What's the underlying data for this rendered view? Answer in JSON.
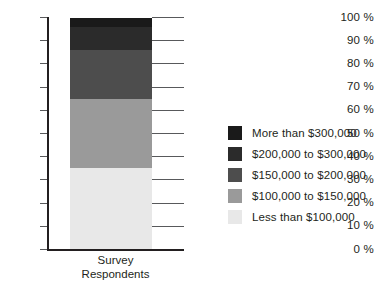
{
  "chart_data": {
    "type": "bar",
    "subtype": "stacked-bar-100",
    "title": "",
    "xlabel": "Survey Respondents",
    "ylabel": "",
    "categories": [
      "Survey Respondents"
    ],
    "ylim": [
      0,
      100
    ],
    "grid": true,
    "legend_position": "right",
    "y_ticks": [
      {
        "value": 0,
        "label": "0 %"
      },
      {
        "value": 10,
        "label": "10 %"
      },
      {
        "value": 20,
        "label": "20 %"
      },
      {
        "value": 30,
        "label": "30 %"
      },
      {
        "value": 40,
        "label": "40 %"
      },
      {
        "value": 50,
        "label": "50 %"
      },
      {
        "value": 60,
        "label": "60 %"
      },
      {
        "value": 70,
        "label": "70 %"
      },
      {
        "value": 80,
        "label": "80 %"
      },
      {
        "value": 90,
        "label": "90 %"
      },
      {
        "value": 100,
        "label": "100 %"
      }
    ],
    "series": [
      {
        "name": "Less than $100,000",
        "values": [
          35
        ],
        "color": "#e8e8e8",
        "range": [
          0,
          35
        ]
      },
      {
        "name": "$100,000 to $150,000",
        "values": [
          30
        ],
        "color": "#9a9a9a",
        "range": [
          35,
          65
        ]
      },
      {
        "name": "$150,000 to $200,000",
        "values": [
          21
        ],
        "color": "#4d4d4d",
        "range": [
          65,
          86
        ]
      },
      {
        "name": "$200,000 to $300,000",
        "values": [
          10
        ],
        "color": "#2b2b2b",
        "range": [
          86,
          96
        ]
      },
      {
        "name": "More than $300,000",
        "values": [
          4
        ],
        "color": "#1a1a1a",
        "range": [
          96,
          100
        ]
      }
    ],
    "legend_entries": [
      {
        "label": "More than $300,000",
        "color": "#1a1a1a"
      },
      {
        "label": "$200,000 to $300,000",
        "color": "#2b2b2b"
      },
      {
        "label": "$150,000 to $200,000",
        "color": "#4d4d4d"
      },
      {
        "label": "$100,000 to $150,000",
        "color": "#9a9a9a"
      },
      {
        "label": "Less than $100,000",
        "color": "#e8e8e8"
      }
    ]
  },
  "axis": {
    "x_label_line1": "Survey",
    "x_label_line2": "Respondents"
  }
}
